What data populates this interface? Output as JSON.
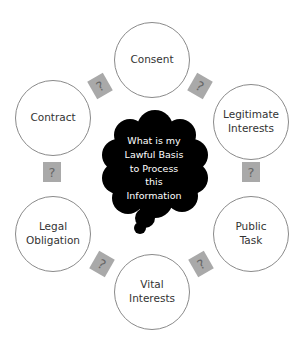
{
  "diagram": {
    "center": {
      "lines": [
        "What is my",
        "Lawful Basis",
        "to Process",
        "this",
        "Information"
      ]
    },
    "nodes": [
      {
        "id": "consent",
        "lines": [
          "Consent"
        ]
      },
      {
        "id": "legitimate-interests",
        "lines": [
          "Legitimate",
          "Interests"
        ]
      },
      {
        "id": "public-task",
        "lines": [
          "Public",
          "Task"
        ]
      },
      {
        "id": "vital-interests",
        "lines": [
          "Vital",
          "Interests"
        ]
      },
      {
        "id": "legal-obligation",
        "lines": [
          "Legal",
          "Obligation"
        ]
      },
      {
        "id": "contract",
        "lines": [
          "Contract"
        ]
      }
    ],
    "connector_symbol": "?",
    "colors": {
      "cloud": "#000000",
      "connector_box": "#a9a9a9",
      "circle_border": "#8a8a8a"
    }
  }
}
